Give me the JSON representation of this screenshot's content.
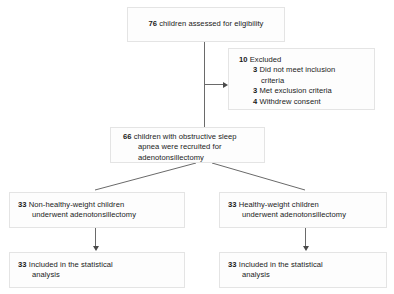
{
  "diagram": {
    "type": "consort-flow-diagram",
    "nodes": {
      "assessed": {
        "lines": [
          {
            "num": "76",
            "text": "children assessed for eligibility"
          }
        ]
      },
      "excluded": {
        "lines": [
          {
            "num": "10",
            "text": "Excluded"
          },
          {
            "num": "3",
            "text": "Did not meet inclusion"
          },
          {
            "num": "",
            "text": "criteria"
          },
          {
            "num": "3",
            "text": "Met exclusion criteria"
          },
          {
            "num": "4",
            "text": "Withdrew consent"
          }
        ]
      },
      "recruited": {
        "lines": [
          {
            "num": "66",
            "text": "children with obstructive sleep"
          },
          {
            "num": "",
            "text": "apnea were recruited for"
          },
          {
            "num": "",
            "text": "adenotonsillectomy"
          }
        ]
      },
      "non_healthy_weight": {
        "lines": [
          {
            "num": "33",
            "text": "Non-healthy-weight children"
          },
          {
            "num": "",
            "text": "underwent adenotonsillectomy"
          }
        ]
      },
      "healthy_weight": {
        "lines": [
          {
            "num": "33",
            "text": "Healthy-weight children"
          },
          {
            "num": "",
            "text": "underwent adenotonsillectomy"
          }
        ]
      },
      "included_left": {
        "lines": [
          {
            "num": "33",
            "text": "Included in the statistical"
          },
          {
            "num": "",
            "text": "analysis"
          }
        ]
      },
      "included_right": {
        "lines": [
          {
            "num": "33",
            "text": "Included in the statistical"
          },
          {
            "num": "",
            "text": "analysis"
          }
        ]
      }
    },
    "colors": {
      "box_fill": "#fdfdfd",
      "box_border": "#e4e4e4",
      "connector": "#6a6a6a",
      "arrow": "#4a4a4a",
      "text": "#1a1a1a"
    }
  }
}
